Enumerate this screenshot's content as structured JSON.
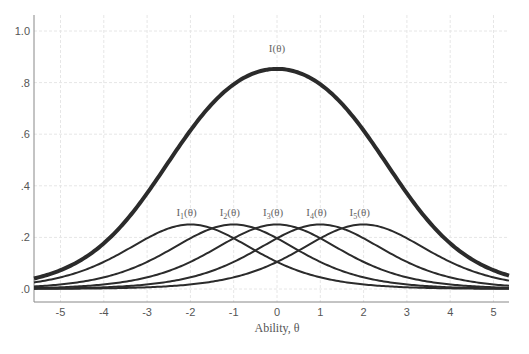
{
  "chart_data": {
    "type": "line",
    "title": "",
    "xlabel": "Ability, θ",
    "ylabel": "",
    "xlim": [
      -5.6,
      5.35
    ],
    "ylim": [
      -0.05,
      1.06
    ],
    "x_ticks": [
      -5,
      -4,
      -3,
      -2,
      -1,
      0,
      1,
      2,
      3,
      4,
      5
    ],
    "x_tick_labels": [
      "-5",
      "-4",
      "-3",
      "-2",
      "-1",
      "0",
      "1",
      "2",
      "3",
      "4",
      "5"
    ],
    "y_ticks": [
      0,
      0.2,
      0.4,
      0.6,
      0.8,
      1.0
    ],
    "y_tick_labels": [
      ".0",
      ".2",
      ".4",
      ".6",
      ".8",
      "1.0"
    ],
    "grid": true,
    "legend": "none (curves labeled inline)",
    "model": "2PL item information, a = 1.0, I_j(θ) = a²·P(1−P)",
    "series": [
      {
        "name": "I(θ)",
        "label": "I(θ)",
        "role": "test-information",
        "peak_theta": 0,
        "peak_value": 0.85,
        "label_theta": 0,
        "label_value": 0.9
      },
      {
        "name": "I1(θ)",
        "label_main": "I",
        "label_sub": "1",
        "label_tail": "(θ)",
        "b": -2,
        "a": 1.0,
        "peak_theta": -2,
        "peak_value": 0.25
      },
      {
        "name": "I2(θ)",
        "label_main": "I",
        "label_sub": "2",
        "label_tail": "(θ)",
        "b": -1,
        "a": 1.0,
        "peak_theta": -1,
        "peak_value": 0.25
      },
      {
        "name": "I3(θ)",
        "label_main": "I",
        "label_sub": "3",
        "label_tail": "(θ)",
        "b": 0,
        "a": 1.0,
        "peak_theta": 0,
        "peak_value": 0.25
      },
      {
        "name": "I4(θ)",
        "label_main": "I",
        "label_sub": "4",
        "label_tail": "(θ)",
        "b": 1,
        "a": 1.0,
        "peak_theta": 1,
        "peak_value": 0.25
      },
      {
        "name": "I5(θ)",
        "label_main": "I",
        "label_sub": "5",
        "label_tail": "(θ)",
        "b": 2,
        "a": 1.0,
        "peak_theta": 2,
        "peak_value": 0.25
      }
    ],
    "sample_points": {
      "x": [
        -5,
        -4,
        -3,
        -2,
        -1,
        0,
        1,
        2,
        3,
        4,
        5
      ],
      "I_total": [
        0.08,
        0.17,
        0.33,
        0.53,
        0.74,
        0.85,
        0.74,
        0.53,
        0.33,
        0.17,
        0.08
      ],
      "I1": [
        0.045,
        0.105,
        0.197,
        0.25,
        0.197,
        0.105,
        0.045,
        0.018,
        0.007,
        0.002,
        0.001
      ],
      "I2": [
        0.018,
        0.045,
        0.105,
        0.197,
        0.25,
        0.197,
        0.105,
        0.045,
        0.018,
        0.007,
        0.002
      ],
      "I3": [
        0.007,
        0.018,
        0.045,
        0.105,
        0.197,
        0.25,
        0.197,
        0.105,
        0.045,
        0.018,
        0.007
      ],
      "I4": [
        0.002,
        0.007,
        0.018,
        0.045,
        0.105,
        0.197,
        0.25,
        0.197,
        0.105,
        0.045,
        0.018
      ],
      "I5": [
        0.001,
        0.002,
        0.007,
        0.018,
        0.045,
        0.105,
        0.197,
        0.25,
        0.197,
        0.105,
        0.045
      ]
    },
    "colors": {
      "curves": "#2b2b2b",
      "grid": "#e6e6e6",
      "axis": "#888888",
      "text": "#555555"
    }
  }
}
